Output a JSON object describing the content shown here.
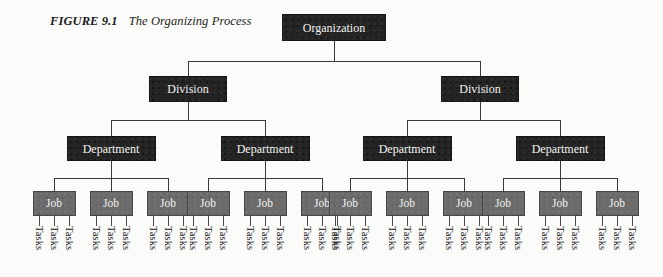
{
  "figure": {
    "label": "FIGURE 9.1",
    "title": "The Organizing Process"
  },
  "colors": {
    "background": "#fbfbfa",
    "dark_node": "#242424",
    "mid_node": "#6b6b6b",
    "node_text": "#f2f2f0",
    "connector": "#3a3a3a",
    "task_text": "#141414"
  },
  "chart_data": {
    "type": "diagram",
    "subtype": "organizational-hierarchy-tree",
    "title": "The Organizing Process",
    "levels": [
      {
        "name": "organization",
        "label": "Organization",
        "count": 1,
        "shade": "dark"
      },
      {
        "name": "division",
        "label": "Division",
        "count": 2,
        "shade": "dark"
      },
      {
        "name": "department",
        "label": "Department",
        "count": 4,
        "shade": "dark"
      },
      {
        "name": "job",
        "label": "Job",
        "count": 12,
        "shade": "mid"
      },
      {
        "name": "tasks",
        "label": "Tasks",
        "count": 36,
        "shade": "text-only"
      }
    ],
    "branching": {
      "organization_to_division": 2,
      "division_to_department": 2,
      "department_to_job": 3,
      "job_to_tasks": 3
    }
  },
  "nodes": {
    "organization": {
      "label": "Organization"
    },
    "divisions": [
      {
        "label": "Division"
      },
      {
        "label": "Division"
      }
    ],
    "departments": [
      {
        "label": "Department"
      },
      {
        "label": "Department"
      },
      {
        "label": "Department"
      },
      {
        "label": "Department"
      }
    ],
    "jobs": [
      {
        "label": "Job"
      },
      {
        "label": "Job"
      },
      {
        "label": "Job"
      },
      {
        "label": "Job"
      },
      {
        "label": "Job"
      },
      {
        "label": "Job"
      },
      {
        "label": "Job"
      },
      {
        "label": "Job"
      },
      {
        "label": "Job"
      },
      {
        "label": "Job"
      },
      {
        "label": "Job"
      },
      {
        "label": "Job"
      }
    ],
    "task_label": "Tasks"
  },
  "layout": {
    "organization": {
      "cx": 334,
      "top": 14
    },
    "divisions_cx": [
      188,
      480
    ],
    "departments_cx": [
      111,
      265,
      407,
      560
    ],
    "jobs_cx": [
      54,
      111,
      168,
      208,
      265,
      322,
      350,
      407,
      464,
      503,
      560,
      617
    ],
    "rows": {
      "org_top": 14,
      "division_top": 76,
      "department_top": 136,
      "job_top": 191,
      "task_stem_top": 216,
      "task_text_top": 226
    }
  }
}
